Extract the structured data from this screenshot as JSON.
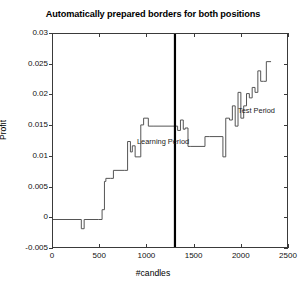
{
  "chart_data": {
    "type": "line",
    "title": "Automatically prepared borders for both positions",
    "xlabel": "#candles",
    "ylabel": "Profit",
    "xlim": [
      0,
      2500
    ],
    "ylim": [
      -0.005,
      0.03
    ],
    "xticks": [
      0,
      500,
      1000,
      1500,
      2000,
      2500
    ],
    "xtick_labels": [
      "0",
      "500",
      "1000",
      "1500",
      "2000",
      "2500"
    ],
    "yticks": [
      -0.005,
      0,
      0.005,
      0.01,
      0.015,
      0.02,
      0.025,
      0.03
    ],
    "ytick_labels": [
      "-0.005",
      "0",
      "0.005",
      "0.01",
      "0.015",
      "0.02",
      "0.025",
      "0.03"
    ],
    "grid": false,
    "legend": null,
    "line_color": "#555555",
    "annotations": [
      {
        "text": "Learning Period",
        "x": 340,
        "y": 0.0185,
        "name": "learning-period-label"
      },
      {
        "text": "Test Period",
        "x": 1420,
        "y": 0.0235,
        "name": "test-period-label"
      }
    ],
    "vlines": [
      {
        "x": 1292,
        "color": "#000000",
        "width": 2.2,
        "name": "period-divider"
      }
    ],
    "series": [
      {
        "name": "Equity curve",
        "x": [
          0,
          300,
          300,
          330,
          330,
          480,
          480,
          520,
          520,
          545,
          545,
          560,
          560,
          610,
          610,
          640,
          640,
          760,
          760,
          790,
          790,
          820,
          820,
          840,
          840,
          870,
          870,
          900,
          900,
          930,
          930,
          960,
          960,
          1010,
          1010,
          1060,
          1060,
          1292,
          1292,
          1320,
          1320,
          1350,
          1350,
          1380,
          1380,
          1400,
          1400,
          1430,
          1430,
          1460,
          1460,
          1610,
          1610,
          1660,
          1660,
          1800,
          1800,
          1830,
          1830,
          1870,
          1870,
          1900,
          1900,
          1930,
          1930,
          1960,
          1960,
          1990,
          1990,
          2020,
          2020,
          2050,
          2050,
          2080,
          2080,
          2110,
          2110,
          2140,
          2140,
          2170,
          2170,
          2200,
          2200,
          2230,
          2230,
          2260,
          2260,
          2310
        ],
        "y": [
          -0.0002,
          -0.0002,
          -0.0017,
          -0.0017,
          -0.0002,
          -0.0002,
          -0.0002,
          -0.0002,
          0.0014,
          0.0014,
          0.006,
          0.006,
          0.0065,
          0.0065,
          0.0065,
          0.0065,
          0.0078,
          0.0078,
          0.0078,
          0.0078,
          0.0125,
          0.0125,
          0.0108,
          0.0108,
          0.0118,
          0.0118,
          0.01,
          0.01,
          0.01,
          0.01,
          0.0152,
          0.0152,
          0.0163,
          0.0163,
          0.015,
          0.015,
          0.015,
          0.015,
          0.015,
          0.015,
          0.0143,
          0.0143,
          0.016,
          0.016,
          0.0145,
          0.0145,
          0.0147,
          0.0147,
          0.0117,
          0.0117,
          0.0117,
          0.0117,
          0.0133,
          0.0133,
          0.0133,
          0.0133,
          0.01,
          0.01,
          0.0163,
          0.0163,
          0.016,
          0.016,
          0.0183,
          0.0183,
          0.015,
          0.015,
          0.0205,
          0.0205,
          0.0163,
          0.0163,
          0.0183,
          0.0183,
          0.0203,
          0.0203,
          0.0196,
          0.0196,
          0.0213,
          0.0213,
          0.0205,
          0.0205,
          0.024,
          0.024,
          0.0223,
          0.0223,
          0.0223,
          0.0223,
          0.0255,
          0.0255
        ]
      }
    ]
  }
}
